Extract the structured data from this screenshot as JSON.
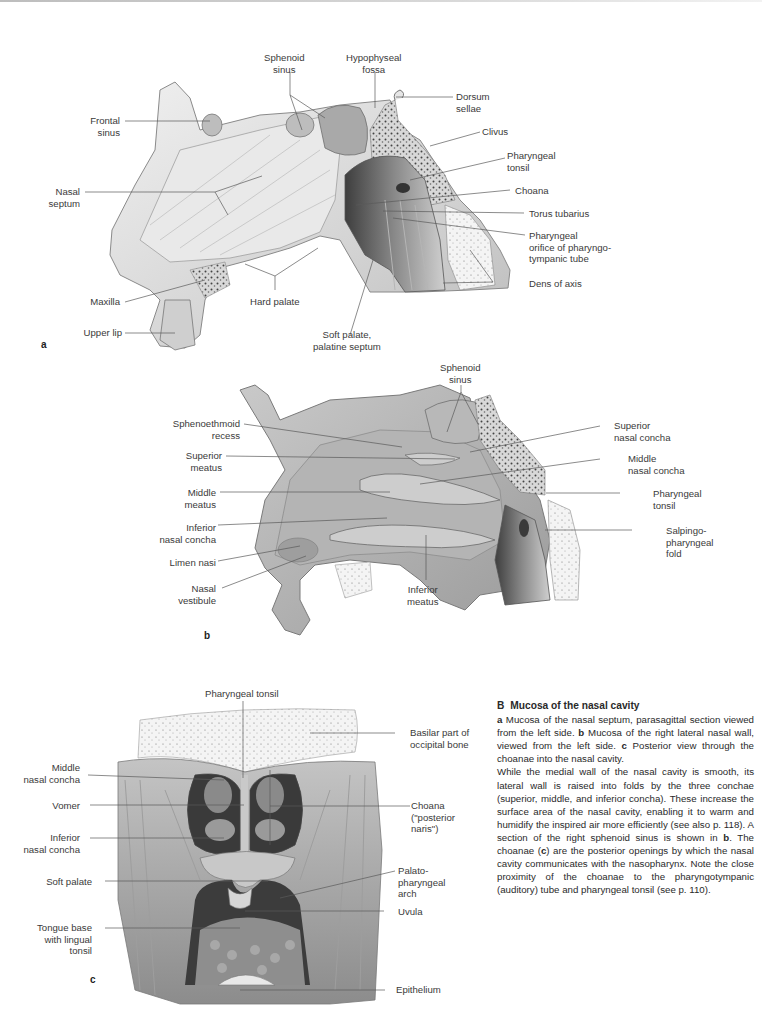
{
  "panels": {
    "a": {
      "letter": "a",
      "labels": {
        "sphenoid_sinus": "Sphenoid\nsinus",
        "hypophyseal_fossa": "Hypophyseal\nfossa",
        "dorsum_sellae": "Dorsum\nsellae",
        "frontal_sinus": "Frontal\nsinus",
        "clivus": "Clivus",
        "pharyngeal_tonsil": "Pharyngeal\ntonsil",
        "nasal_septum": "Nasal\nseptum",
        "choana": "Choana",
        "torus_tubarius": "Torus tubarius",
        "pharyngeal_orifice": "Pharyngeal\norifice of pharyngo-\ntympanic tube",
        "maxilla": "Maxilla",
        "hard_palate": "Hard palate",
        "dens_of_axis": "Dens of axis",
        "upper_lip": "Upper lip",
        "soft_palate": "Soft palate,\npalatine septum"
      }
    },
    "b": {
      "letter": "b",
      "labels": {
        "sphenoid_sinus": "Sphenoid\nsinus",
        "sphenoethmoid_recess": "Sphenoethmoid\nrecess",
        "superior_nasal_concha": "Superior\nnasal concha",
        "superior_meatus": "Superior\nmeatus",
        "middle_nasal_concha": "Middle\nnasal concha",
        "middle_meatus": "Middle\nmeatus",
        "pharyngeal_tonsil": "Pharyngeal\ntonsil",
        "inferior_nasal_concha": "Inferior\nnasal concha",
        "salpingopharyngeal_fold": "Salpingo-\npharyngeal\nfold",
        "limen_nasi": "Limen nasi",
        "nasal_vestibule": "Nasal\nvestibule",
        "inferior_meatus": "Inferior\nmeatus"
      }
    },
    "c": {
      "letter": "c",
      "labels": {
        "pharyngeal_tonsil": "Pharyngeal tonsil",
        "basilar_part": "Basilar part of\noccipital bone",
        "middle_nasal_concha": "Middle\nnasal concha",
        "vomer": "Vomer",
        "choana": "Choana\n(\"posterior\nnaris\")",
        "inferior_nasal_concha": "Inferior\nnasal concha",
        "soft_palate": "Soft palate",
        "palatopharyngeal_arch": "Palato-\npharyngeal\narch",
        "uvula": "Uvula",
        "tongue_base": "Tongue base\nwith lingual\ntonsil",
        "epithelium": "Epithelium"
      }
    }
  },
  "caption": {
    "figure_id": "B",
    "title": "Mucosa of the nasal cavity",
    "a_key": "a",
    "a_text": " Mucosa of the nasal septum, parasagittal section viewed from the left side. ",
    "b_key": "b",
    "b_text": " Mucosa of the right lateral nasal wall, viewed from the left side. ",
    "c_key": "c",
    "c_text": " Posterior view through the choanae into the nasal cavity.",
    "body_1": "While the medial wall of the nasal cavity is smooth, its lateral wall is raised into folds by the three conchae (superior, middle, and inferior concha). These increase the surface area of the nasal cavity, enabling it to warm and humidify the inspired air more efficiently (see also p. 118). A section of the right sphenoid sinus is shown in ",
    "body_b": "b",
    "body_2": ". The choanae (",
    "body_c": "c",
    "body_3": ") are the posterior openings by which the nasal cavity communicates with the nasopharynx. Note the close proximity of the choanae to the pharyngotympanic (auditory) tube and pharyngeal tonsil (see p. 110)."
  },
  "colors": {
    "background": "#ffffff",
    "text": "#2a2a2a",
    "leader_line": "#5a5a5a",
    "tissue_light": "#e4e4e4",
    "tissue_mid": "#b8b8b8",
    "tissue_dark": "#5e5e5e"
  }
}
